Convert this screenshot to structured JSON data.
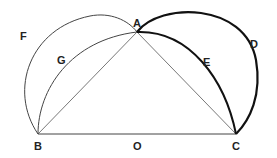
{
  "diagram": {
    "type": "geometric-figure",
    "points": {
      "A": {
        "label": "A",
        "x": 137,
        "y": 32
      },
      "B": {
        "label": "B",
        "x": 38,
        "y": 134
      },
      "C": {
        "label": "C",
        "x": 236,
        "y": 134
      },
      "O": {
        "label": "O",
        "x": 137,
        "y": 134
      },
      "D": {
        "label": "D",
        "x": 254,
        "y": 44
      },
      "E": {
        "label": "E",
        "x": 206,
        "y": 64
      },
      "F": {
        "label": "F",
        "x": 20,
        "y": 42
      },
      "G": {
        "label": "G",
        "x": 62,
        "y": 60
      }
    },
    "labels": [
      "A",
      "B",
      "C",
      "D",
      "E",
      "F",
      "G",
      "O"
    ],
    "colors": {
      "thin": "#444444",
      "thick": "#111111",
      "background": "#ffffff"
    }
  }
}
